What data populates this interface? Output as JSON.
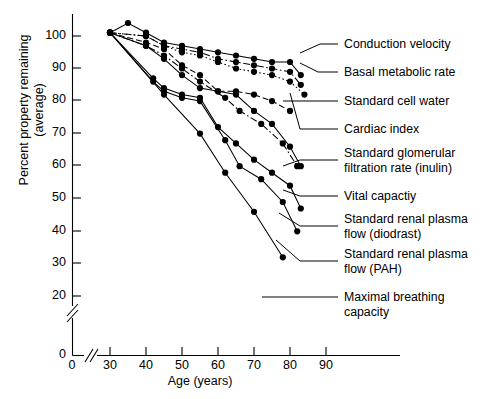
{
  "chart_data": {
    "type": "line",
    "title": "",
    "xlabel": "Age (years)",
    "ylabel": "Percent property remaining (average)",
    "xlim": [
      28,
      92
    ],
    "ylim": [
      18,
      106
    ],
    "grid": false,
    "legend_position": "right-callouts",
    "axis_breaks": {
      "x": true,
      "y": true
    },
    "xticks": [
      "0",
      "30",
      "40",
      "50",
      "60",
      "70",
      "80",
      "90"
    ],
    "yticks": [
      "0",
      "20",
      "30",
      "40",
      "50",
      "60",
      "70",
      "80",
      "90",
      "100"
    ],
    "series": [
      {
        "name": "Conduction velocity",
        "style": "solid",
        "x": [
          30,
          35,
          40,
          45,
          50,
          55,
          60,
          65,
          70,
          75,
          80,
          83
        ],
        "y": [
          101,
          104,
          101,
          98,
          97,
          96,
          95,
          94,
          93,
          92,
          92,
          88
        ]
      },
      {
        "name": "Basal metabolic rate",
        "style": "dash-dot",
        "x": [
          30,
          40,
          45,
          50,
          55,
          60,
          65,
          70,
          75,
          80,
          83
        ],
        "y": [
          101,
          100,
          97,
          96,
          95,
          93,
          92,
          91,
          90,
          89,
          85
        ]
      },
      {
        "name": "Standard cell water",
        "style": "dotted",
        "x": [
          30,
          40,
          45,
          50,
          55,
          60,
          65,
          70,
          75,
          80,
          84
        ],
        "y": [
          101,
          100,
          97,
          95,
          94,
          92,
          90,
          89,
          88,
          86,
          82
        ]
      },
      {
        "name": "Cardiac index",
        "style": "dashed",
        "x": [
          30,
          40,
          45,
          50,
          55,
          60,
          65,
          70,
          75,
          80
        ],
        "y": [
          101,
          98,
          96,
          91,
          88,
          83,
          83,
          82,
          80,
          77
        ]
      },
      {
        "name": "Standard glomerular filtration rate (inulin)",
        "style": "dash-dot",
        "x": [
          30,
          40,
          45,
          50,
          55,
          62,
          66,
          72,
          78,
          82
        ],
        "y": [
          101,
          97,
          94,
          90,
          86,
          81,
          77,
          73,
          67,
          60
        ]
      },
      {
        "name": "Vital capactiy",
        "style": "solid",
        "x": [
          30,
          40,
          45,
          50,
          55,
          60,
          65,
          70,
          75,
          80,
          83
        ],
        "y": [
          101,
          97,
          93,
          88,
          84,
          83,
          82,
          77,
          73,
          66,
          60
        ]
      },
      {
        "name": "Standard renal plasma flow (diodrast)",
        "style": "solid",
        "x": [
          30,
          42,
          45,
          50,
          55,
          60,
          65,
          70,
          75,
          80,
          83
        ],
        "y": [
          101,
          87,
          84,
          82,
          81,
          72,
          67,
          62,
          58,
          54,
          47
        ]
      },
      {
        "name": "Standard renal plasma flow (PAH)",
        "style": "solid",
        "x": [
          30,
          42,
          45,
          50,
          55,
          62,
          66,
          72,
          78,
          82
        ],
        "y": [
          101,
          86,
          83,
          81,
          80,
          68,
          60,
          56,
          49,
          40
        ]
      },
      {
        "name": "Maximal breathing capacity",
        "style": "solid",
        "x": [
          30,
          45,
          55,
          62,
          70,
          78
        ],
        "y": [
          101,
          82,
          70,
          58,
          46,
          32
        ]
      }
    ]
  },
  "axis": {
    "x_title": "Age (years)",
    "y_title_line1": "Percent property remaining",
    "y_title_line2": "(average)",
    "x_ticks": [
      {
        "label": "0",
        "px": 72
      },
      {
        "label": "30",
        "px": 110
      },
      {
        "label": "40",
        "px": 146
      },
      {
        "label": "50",
        "px": 182
      },
      {
        "label": "60",
        "px": 218
      },
      {
        "label": "70",
        "px": 254
      },
      {
        "label": "80",
        "px": 290
      },
      {
        "label": "90",
        "px": 326
      }
    ],
    "y_ticks": [
      {
        "label": "100",
        "px": 36
      },
      {
        "label": "90",
        "px": 68
      },
      {
        "label": "80",
        "px": 100
      },
      {
        "label": "70",
        "px": 133
      },
      {
        "label": "60",
        "px": 165
      },
      {
        "label": "50",
        "px": 198
      },
      {
        "label": "40",
        "px": 231
      },
      {
        "label": "30",
        "px": 263
      },
      {
        "label": "20",
        "px": 296
      },
      {
        "label": "0",
        "px": 355
      }
    ]
  },
  "callouts": [
    {
      "label": "Conduction velocity"
    },
    {
      "label": "Basal metabolic rate"
    },
    {
      "label": "Standard cell water"
    },
    {
      "label": "Cardiac index"
    },
    {
      "label": "Standard glomerular"
    },
    {
      "label": "filtration rate (inulin)"
    },
    {
      "label": "Vital capactiy"
    },
    {
      "label": "Standard renal plasma"
    },
    {
      "label": "flow (diodrast)"
    },
    {
      "label": "Standard renal plasma"
    },
    {
      "label": "flow (PAH)"
    },
    {
      "label": "Maximal breathing"
    },
    {
      "label": "capacity"
    }
  ],
  "colors": {
    "ink": "#000000",
    "background": "#ffffff"
  }
}
